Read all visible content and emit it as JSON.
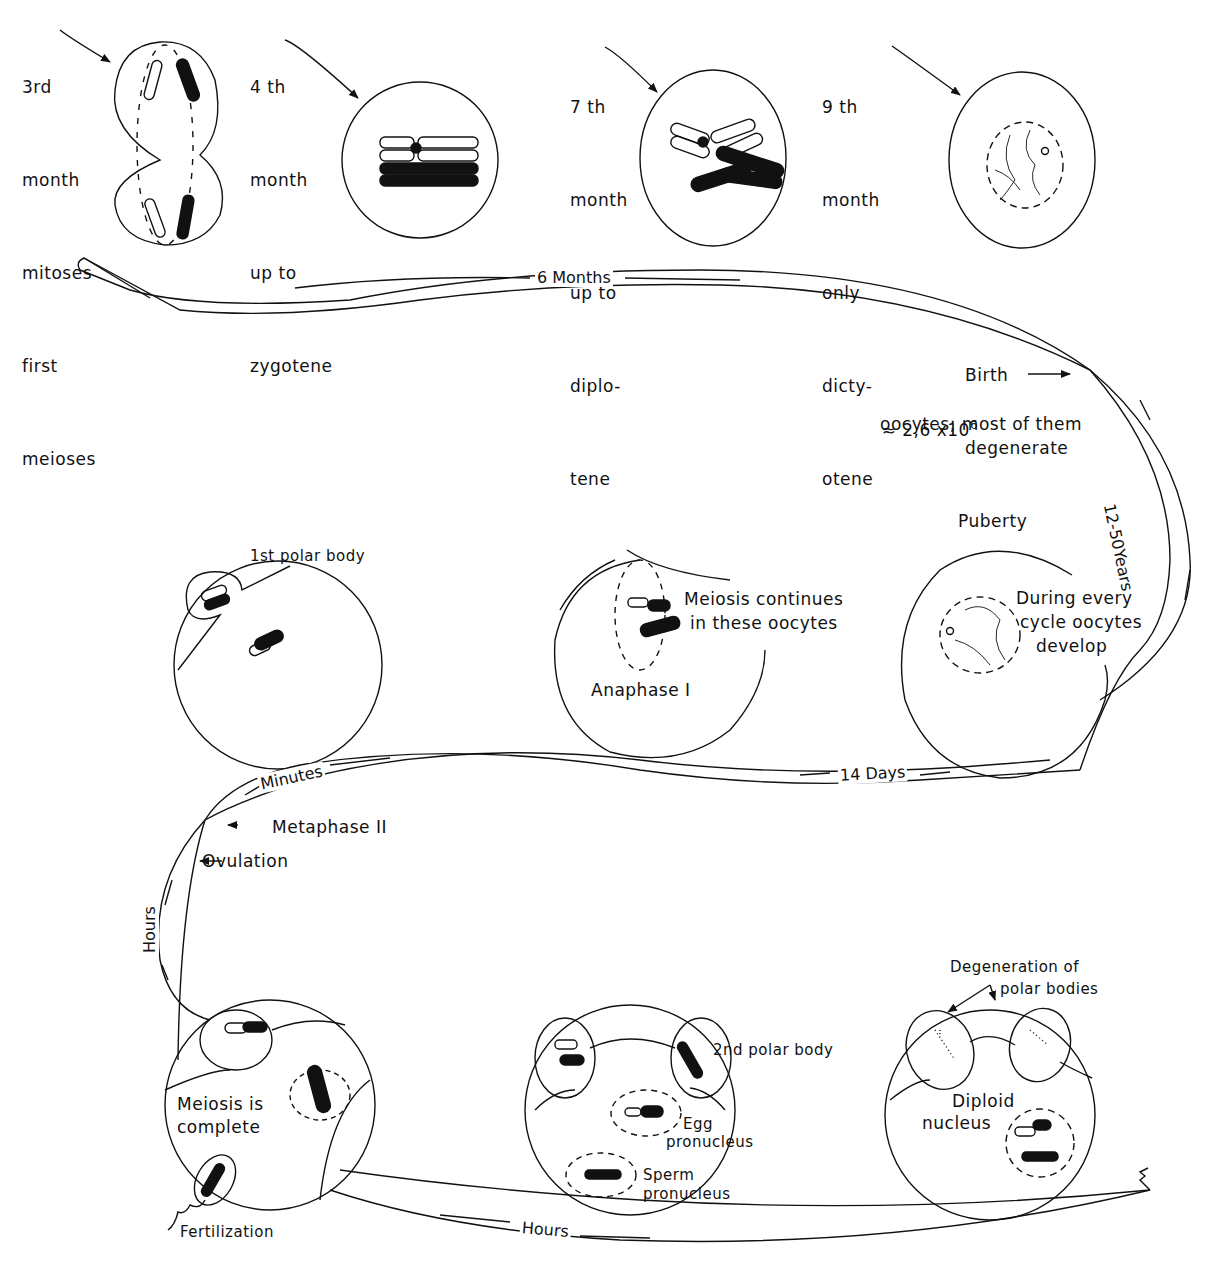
{
  "diagram": {
    "type": "oogenesis timeline",
    "colors": {
      "ink": "#111111",
      "background": "#ffffff"
    },
    "prenatal_stages": [
      {
        "lines": [
          "3rd",
          "month",
          "mitoses",
          "first",
          "meioses"
        ]
      },
      {
        "lines": [
          "4 th",
          "month",
          "up to",
          "zygotene"
        ]
      },
      {
        "lines": [
          "7 th",
          "month",
          "up to",
          "diplo-",
          "tene"
        ]
      },
      {
        "lines": [
          "9 th",
          "month",
          "only",
          "dicty-",
          "otene"
        ]
      }
    ],
    "band_labels": {
      "six_months": "6 Months",
      "years": "12-50Years",
      "fourteen_days": "14 Days",
      "minutes": "Minutes",
      "hours_left": "Hours",
      "hours_bottom": "Hours"
    },
    "birth": {
      "label": "Birth",
      "count_prefix": "≈ 2,6 x10",
      "count_exponent": "6",
      "note_line1": "oocytes; most of them",
      "note_line2": "degenerate"
    },
    "puberty": {
      "label": "Puberty",
      "note": [
        "During every",
        "cycle oocytes",
        "develop"
      ]
    },
    "meiosis_continues": {
      "note": [
        "Meiosis continues",
        "in these oocytes"
      ],
      "phase": "Anaphase I"
    },
    "first_polar": {
      "label": "1st polar body"
    },
    "events": {
      "metaphase": "Metaphase II",
      "ovulation": "Ovulation"
    },
    "fertilization": {
      "note": [
        "Meiosis is",
        "complete"
      ],
      "label": "Fertilization"
    },
    "pronuclei": {
      "polar": "2nd polar body",
      "egg": [
        "Egg",
        "pronucleus"
      ],
      "sperm": [
        "Sperm",
        "pronucleus"
      ]
    },
    "zygote": {
      "degeneration": [
        "Degeneration of",
        "polar bodies"
      ],
      "nucleus": [
        "Diploid",
        "nucleus"
      ]
    }
  }
}
